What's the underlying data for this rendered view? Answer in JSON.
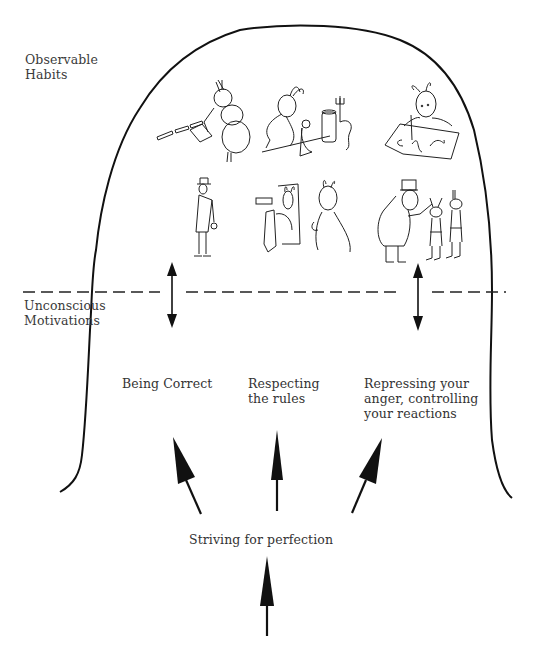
{
  "diagram": {
    "type": "iceberg-head",
    "colors": {
      "stroke": "#111111",
      "text": "#333333",
      "background": "#ffffff"
    },
    "layers": {
      "top": {
        "label": "Observable\nHabits",
        "illustrations": [
          {
            "name": "ant-filing-papers",
            "description": "ant sorting documents"
          },
          {
            "name": "ant-cleaning-with-pitchfork",
            "description": "ants tidying with bin and pitchfork"
          },
          {
            "name": "ant-writing-calligraphy",
            "description": "ant writing neat cursive"
          },
          {
            "name": "man-standing-straight",
            "description": "man in hat standing upright"
          },
          {
            "name": "ants-at-mirror",
            "description": "ants dressing before a mirror"
          },
          {
            "name": "officer-inspecting-ants",
            "description": "officer inspecting standing ants"
          }
        ]
      },
      "bottom": {
        "label": "Unconscious\nMotivations"
      }
    },
    "motivations": [
      {
        "label": "Being Correct"
      },
      {
        "label": "Respecting\nthe rules"
      },
      {
        "label": "Repressing your\nanger, controlling\nyour reactions"
      }
    ],
    "root": {
      "label": "Striving for perfection"
    }
  }
}
